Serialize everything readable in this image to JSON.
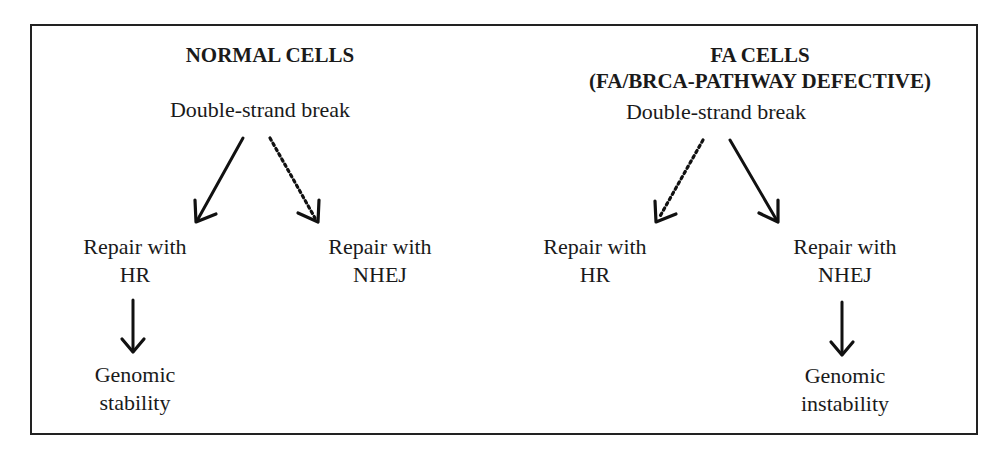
{
  "diagram": {
    "normal": {
      "title": "NORMAL CELLS",
      "root": "Double-strand break",
      "left_branch": {
        "line1": "Repair with",
        "line2": "HR",
        "arrow": "solid"
      },
      "right_branch": {
        "line1": "Repair with",
        "line2": "NHEJ",
        "arrow": "dotted"
      },
      "outcome": {
        "line1": "Genomic",
        "line2": "stability"
      }
    },
    "fa": {
      "title_line1": "FA CELLS",
      "title_line2": "(FA/BRCA-PATHWAY DEFECTIVE)",
      "root": "Double-strand break",
      "left_branch": {
        "line1": "Repair with",
        "line2": "HR",
        "arrow": "dotted"
      },
      "right_branch": {
        "line1": "Repair with",
        "line2": "NHEJ",
        "arrow": "solid"
      },
      "outcome": {
        "line1": "Genomic",
        "line2": "instability"
      }
    },
    "colors": {
      "ink": "#1a1a1a",
      "border": "#222222",
      "background": "#ffffff"
    }
  }
}
